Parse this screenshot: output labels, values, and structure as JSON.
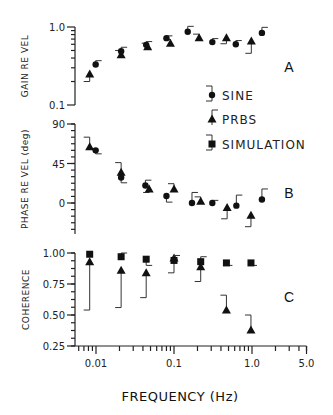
{
  "chart_data": {
    "type": "scatter",
    "xlabel": "FREQUENCY (Hz)",
    "xscale": "log",
    "xlim": [
      0.0054,
      5.0
    ],
    "xticks": [
      {
        "value": 0.01,
        "label": "0.01"
      },
      {
        "value": 0.1,
        "label": "0.1"
      },
      {
        "value": 1.0,
        "label": "1.0"
      },
      {
        "value": 5.0,
        "label": "5.0"
      }
    ],
    "legend": {
      "placement": "right",
      "entries": [
        {
          "name": "SINE",
          "marker": "circle"
        },
        {
          "name": "PRBS",
          "marker": "triangle"
        },
        {
          "name": "SIMULATION",
          "marker": "square"
        }
      ]
    },
    "panels": [
      {
        "id": "A",
        "ylabel": "GAIN RE VEL",
        "yscale": "log",
        "ylim": [
          0.1,
          1.0
        ],
        "yticks": [
          {
            "value": 1.0,
            "label": "1.0"
          },
          {
            "value": 0.1,
            "label": "0.1"
          }
        ],
        "series": [
          {
            "name": "PRBS",
            "marker": "triangle",
            "points": [
              {
                "x": 0.0083,
                "y": 0.25,
                "err": -0.05
              },
              {
                "x": 0.021,
                "y": 0.44,
                "err": 0.06
              },
              {
                "x": 0.046,
                "y": 0.56,
                "err": 0.06
              },
              {
                "x": 0.09,
                "y": 0.62,
                "err": 0.07
              },
              {
                "x": 0.21,
                "y": 0.73,
                "err": 0.08
              },
              {
                "x": 0.47,
                "y": 0.73,
                "err": -0.12
              },
              {
                "x": 0.98,
                "y": 0.66,
                "err": -0.2
              }
            ]
          },
          {
            "name": "SINE",
            "marker": "circle",
            "points": [
              {
                "x": 0.0099,
                "y": 0.33,
                "err": 0.04
              },
              {
                "x": 0.021,
                "y": 0.49,
                "err": 0.06
              },
              {
                "x": 0.044,
                "y": 0.59,
                "err": 0.06
              },
              {
                "x": 0.08,
                "y": 0.72,
                "err": 0.05
              },
              {
                "x": 0.15,
                "y": 0.87,
                "err": 0.15
              },
              {
                "x": 0.31,
                "y": 0.64,
                "err": 0.07
              },
              {
                "x": 0.62,
                "y": 0.6,
                "err": 0.07
              },
              {
                "x": 1.34,
                "y": 0.84,
                "err": 0.15
              }
            ]
          }
        ]
      },
      {
        "id": "B",
        "ylabel": "PHASE RE VEL (deg)",
        "yscale": "linear",
        "ylim": [
          -35,
          90
        ],
        "yticks": [
          {
            "value": 90,
            "label": "90"
          },
          {
            "value": 45,
            "label": "45"
          },
          {
            "value": 0,
            "label": "0"
          }
        ],
        "series": [
          {
            "name": "PRBS",
            "marker": "triangle",
            "points": [
              {
                "x": 0.0083,
                "y": 64,
                "err": 11
              },
              {
                "x": 0.021,
                "y": 35,
                "err": 11
              },
              {
                "x": 0.048,
                "y": 16,
                "err": -4
              },
              {
                "x": 0.1,
                "y": 16,
                "err": 6
              },
              {
                "x": 0.22,
                "y": 2,
                "err": 5
              },
              {
                "x": 0.48,
                "y": -5,
                "err": -13
              },
              {
                "x": 0.97,
                "y": -14,
                "err": -13
              }
            ]
          },
          {
            "name": "SINE",
            "marker": "circle",
            "points": [
              {
                "x": 0.0099,
                "y": 60,
                "err": -4
              },
              {
                "x": 0.021,
                "y": 29,
                "err": -6
              },
              {
                "x": 0.043,
                "y": 20,
                "err": 6
              },
              {
                "x": 0.08,
                "y": 8,
                "err": -7
              },
              {
                "x": 0.17,
                "y": 0,
                "err": 12
              },
              {
                "x": 0.31,
                "y": 0,
                "err": 3
              },
              {
                "x": 0.63,
                "y": -3,
                "err": 12
              },
              {
                "x": 1.34,
                "y": 4,
                "err": 12
              }
            ]
          }
        ]
      },
      {
        "id": "C",
        "ylabel": "COHERENCE",
        "yscale": "linear",
        "ylim": [
          0.25,
          1.0
        ],
        "yticks": [
          {
            "value": 1.0,
            "label": "1.00"
          },
          {
            "value": 0.75,
            "label": "0.75"
          },
          {
            "value": 0.5,
            "label": "0.50"
          },
          {
            "value": 0.25,
            "label": "0.25"
          }
        ],
        "series": [
          {
            "name": "PRBS",
            "marker": "triangle",
            "points": [
              {
                "x": 0.0083,
                "y": 0.93,
                "err": -0.39
              },
              {
                "x": 0.021,
                "y": 0.86,
                "err": -0.3
              },
              {
                "x": 0.044,
                "y": 0.84,
                "err": -0.2
              },
              {
                "x": 0.1,
                "y": 0.96,
                "err": -0.12
              },
              {
                "x": 0.22,
                "y": 0.89,
                "err": -0.12
              },
              {
                "x": 0.47,
                "y": 0.54,
                "err": 0.12
              },
              {
                "x": 0.97,
                "y": 0.38,
                "err": 0.12
              }
            ]
          },
          {
            "name": "SIMULATION",
            "marker": "square",
            "points": [
              {
                "x": 0.0083,
                "y": 0.99,
                "err": 0.0
              },
              {
                "x": 0.021,
                "y": 0.97,
                "err": 0.03
              },
              {
                "x": 0.044,
                "y": 0.95,
                "err": -0.05
              },
              {
                "x": 0.1,
                "y": 0.94,
                "err": 0.04
              },
              {
                "x": 0.22,
                "y": 0.93,
                "err": 0.04
              },
              {
                "x": 0.47,
                "y": 0.92,
                "err": -0.02
              },
              {
                "x": 0.97,
                "y": 0.92,
                "err": -0.02
              }
            ]
          }
        ]
      }
    ]
  }
}
